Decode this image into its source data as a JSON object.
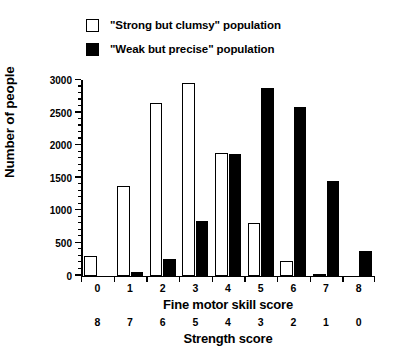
{
  "chart_data": {
    "type": "bar",
    "title": "",
    "subtitle": "",
    "xlabel": "Fine motor skill score",
    "xlabel_secondary": "Strength score",
    "ylabel": "Number of people",
    "categories": [
      "0",
      "1",
      "2",
      "3",
      "4",
      "5",
      "6",
      "7",
      "8"
    ],
    "categories_secondary": [
      "8",
      "7",
      "6",
      "5",
      "4",
      "3",
      "2",
      "1",
      "0"
    ],
    "ylim": [
      0,
      3000
    ],
    "yticks": [
      0,
      500,
      1000,
      1500,
      2000,
      2500,
      3000
    ],
    "ytick_labels": [
      "0",
      "500",
      "1000",
      "1500",
      "2000",
      "2500",
      "3000"
    ],
    "yminor_step": 100,
    "grid": false,
    "legend_position": "top-left",
    "series": [
      {
        "name": "\"Strong but clumsy\" population",
        "style": "open",
        "color": "#ffffff",
        "edgecolor": "#000000",
        "values": [
          300,
          1380,
          2650,
          2950,
          1880,
          800,
          220,
          30,
          0
        ]
      },
      {
        "name": "\"Weak but precise\" population",
        "style": "filled",
        "color": "#000000",
        "edgecolor": "#000000",
        "values": [
          0,
          50,
          250,
          830,
          1860,
          2880,
          2580,
          1450,
          370
        ]
      }
    ]
  },
  "legend": {
    "items": [
      {
        "label": "\"Strong but clumsy\" population",
        "swatch": "open-square-swatch"
      },
      {
        "label": "\"Weak but precise\" population",
        "swatch": "filled-square-swatch"
      }
    ]
  },
  "axes": {
    "y_title": "Number of people",
    "x_title_primary": "Fine motor skill score",
    "x_title_secondary": "Strength score"
  }
}
